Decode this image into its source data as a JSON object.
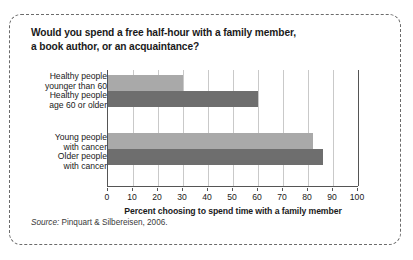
{
  "figure": {
    "title": "Would you spend a free half-hour with a family member, a book author, or an acquaintance?",
    "title_line1": "Would you spend a free half-hour with a family member,",
    "title_line2": "a book author, or an acquaintance?",
    "source_label": "Source:",
    "source_text": " Pinquart & Silbereisen, 2006.",
    "colors": {
      "bar_light": "#a9a9a9",
      "bar_dark": "#6e6e6e",
      "axis": "#555555",
      "gridline": "#c9c9c9",
      "border": "#6b6b6b",
      "text": "#1a1a1a"
    }
  },
  "chart_data": {
    "type": "bar",
    "orientation": "horizontal",
    "title": "Would you spend a free half-hour with a family member, a book author, or an acquaintance?",
    "xlabel": "Percent choosing to spend time with a family member",
    "ylabel": "",
    "xlim": [
      0,
      100
    ],
    "xticks": [
      0,
      10,
      20,
      30,
      40,
      50,
      60,
      70,
      80,
      90,
      100
    ],
    "xtick_labels": [
      "0",
      "10",
      "20",
      "30",
      "40",
      "50",
      "60",
      "70",
      "80",
      "90",
      "100"
    ],
    "grid": "vertical",
    "legend": "none",
    "categories": [
      "Healthy people younger than 60",
      "Healthy people age 60 or older",
      "Young people with cancer",
      "Older people with cancer"
    ],
    "category_lines": [
      [
        "Healthy people",
        "younger than 60"
      ],
      [
        "Healthy people",
        "age 60 or older"
      ],
      [
        "Young people",
        "with cancer"
      ],
      [
        "Older people",
        "with cancer"
      ]
    ],
    "values": [
      30,
      60,
      82,
      86
    ],
    "bar_colors": [
      "#a9a9a9",
      "#6e6e6e",
      "#a9a9a9",
      "#6e6e6e"
    ],
    "source": "Pinquart & Silbereisen, 2006."
  }
}
